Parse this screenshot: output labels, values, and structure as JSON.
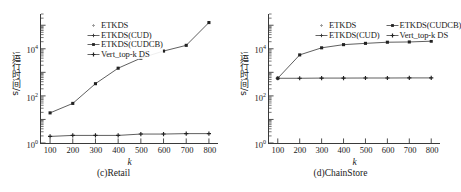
{
  "figure": {
    "panels": [
      {
        "id": "c",
        "caption": "(c)Retail",
        "xtitle": "k",
        "ytitle": "运行时间/s",
        "legend": [
          {
            "label": "ETKDS",
            "marker": "plus-light"
          },
          {
            "label": "ETKDS(CUD)",
            "marker": "line-plus"
          },
          {
            "label": "ETKDS(CUDCB)",
            "marker": "line-square"
          },
          {
            "label": "Vert_top-k DS",
            "marker": "line-plus-bold"
          }
        ]
      },
      {
        "id": "d",
        "caption": "(d)ChainStore",
        "xtitle": "k",
        "ytitle": "运行时间/s",
        "legend": [
          {
            "label": "ETKDS",
            "marker": "plus-light"
          },
          {
            "label": "ETKDS(CUDCB)",
            "marker": "line-square"
          },
          {
            "label": "ETKDS(CUD)",
            "marker": "line-plus"
          },
          {
            "label": "Vert_top-k DS",
            "marker": "line-plus-bold"
          }
        ]
      }
    ]
  },
  "chart_data": [
    {
      "type": "line",
      "panel": "(c)Retail",
      "title": "(c)Retail",
      "xlabel": "k",
      "ylabel": "运行时间/s",
      "yscale": "log",
      "ylim": [
        1,
        300000
      ],
      "yticks": [
        1,
        100,
        10000
      ],
      "yticklabels": [
        "10^0",
        "10^2",
        "10^4"
      ],
      "xlim": [
        60,
        840
      ],
      "xticks": [
        100,
        200,
        300,
        400,
        500,
        600,
        700,
        800
      ],
      "xticklabels": [
        "100",
        "200",
        "300",
        "400",
        "500",
        "600",
        "700",
        "800"
      ],
      "grid": false,
      "legend_position": "upper-left",
      "x": [
        100,
        200,
        300,
        400,
        500,
        600,
        700,
        800
      ],
      "series": [
        {
          "name": "ETKDS(CUDCB)",
          "marker": "square",
          "values": [
            19,
            48,
            330,
            1500,
            4000,
            8000,
            14000,
            130000
          ]
        },
        {
          "name": "Vert_top-k DS",
          "marker": "plus",
          "values": [
            1.9,
            2.1,
            2.1,
            2.1,
            2.4,
            2.4,
            2.5,
            2.5
          ]
        }
      ]
    },
    {
      "type": "line",
      "panel": "(d)ChainStore",
      "title": "(d)ChainStore",
      "xlabel": "k",
      "ylabel": "运行时间/s",
      "yscale": "log",
      "ylim": [
        1,
        300000
      ],
      "yticks": [
        1,
        100,
        10000
      ],
      "yticklabels": [
        "10^0",
        "10^2",
        "10^4"
      ],
      "xlim": [
        60,
        840
      ],
      "xticks": [
        100,
        200,
        300,
        400,
        500,
        600,
        700,
        800
      ],
      "xticklabels": [
        "100",
        "200",
        "300",
        "400",
        "500",
        "600",
        "700",
        "800"
      ],
      "grid": false,
      "legend_position": "upper-center",
      "x": [
        100,
        200,
        300,
        400,
        500,
        600,
        700,
        800
      ],
      "series": [
        {
          "name": "ETKDS(CUDCB)",
          "marker": "square",
          "values": [
            560,
            5500,
            11000,
            15000,
            17000,
            19000,
            19500,
            21000
          ]
        },
        {
          "name": "Vert_top-k DS",
          "marker": "plus",
          "values": [
            560,
            560,
            570,
            570,
            575,
            575,
            580,
            580
          ]
        }
      ]
    }
  ],
  "colors": {
    "axis": "#3a3a3a",
    "line": "#555555",
    "marker": "#222222",
    "text": "#1a1a1a"
  }
}
